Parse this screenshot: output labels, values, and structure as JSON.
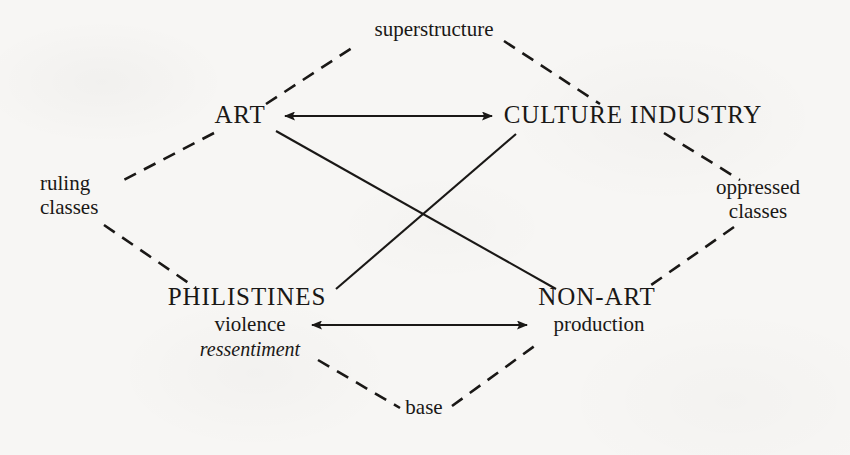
{
  "figure": {
    "type": "concept-diagram",
    "shape": "rhombus",
    "background_color": "#f7f6f4",
    "ink_color": "#1a1816"
  },
  "nodes": {
    "art": {
      "label": "ART",
      "position": "top-left"
    },
    "culture_industry": {
      "label": "CULTURE INDUSTRY",
      "position": "top-right"
    },
    "philistines": {
      "label": "PHILISTINES",
      "position": "bottom-left",
      "sub_1": "violence",
      "sub_2": "ressentiment"
    },
    "non_art": {
      "label": "NON-ART",
      "position": "bottom-right",
      "sub_1": "production"
    }
  },
  "apex_labels": {
    "top": "superstructure",
    "bottom": "base",
    "left_line_1": "ruling",
    "left_line_2": "classes",
    "right_line_1": "oppressed",
    "right_line_2": "classes"
  },
  "connections": [
    {
      "from": "ART",
      "to": "CULTURE INDUSTRY",
      "style": "solid",
      "arrows": "both"
    },
    {
      "from": "violence",
      "to": "production",
      "style": "solid",
      "arrows": "both"
    },
    {
      "from": "ART",
      "to": "NON-ART",
      "style": "solid",
      "arrows": "none"
    },
    {
      "from": "CULTURE INDUSTRY",
      "to": "PHILISTINES",
      "style": "solid",
      "arrows": "none"
    },
    {
      "from": "ART",
      "to": "superstructure",
      "style": "dashed",
      "arrows": "none"
    },
    {
      "from": "superstructure",
      "to": "CULTURE INDUSTRY",
      "style": "dashed",
      "arrows": "none"
    },
    {
      "from": "ART",
      "to": "ruling classes",
      "style": "dashed",
      "arrows": "none"
    },
    {
      "from": "ruling classes",
      "to": "PHILISTINES",
      "style": "dashed",
      "arrows": "none"
    },
    {
      "from": "CULTURE INDUSTRY",
      "to": "oppressed classes",
      "style": "dashed",
      "arrows": "none"
    },
    {
      "from": "oppressed classes",
      "to": "NON-ART",
      "style": "dashed",
      "arrows": "none"
    },
    {
      "from": "PHILISTINES",
      "to": "base",
      "style": "dashed",
      "arrows": "none"
    },
    {
      "from": "base",
      "to": "NON-ART",
      "style": "dashed",
      "arrows": "none"
    }
  ]
}
